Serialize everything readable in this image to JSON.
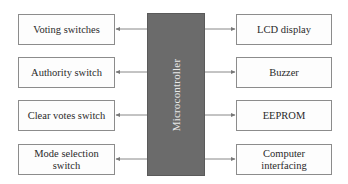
{
  "diagram": {
    "center": {
      "label": "Microcontroller",
      "color": "#6b6b6b"
    },
    "inputs": [
      {
        "label": "Voting switches"
      },
      {
        "label": "Authority switch"
      },
      {
        "label": "Clear votes switch"
      },
      {
        "label": "Mode selection switch"
      }
    ],
    "outputs": [
      {
        "label": "LCD display"
      },
      {
        "label": "Buzzer"
      },
      {
        "label": "EEPROM"
      },
      {
        "label": "Computer interfacing"
      }
    ]
  }
}
